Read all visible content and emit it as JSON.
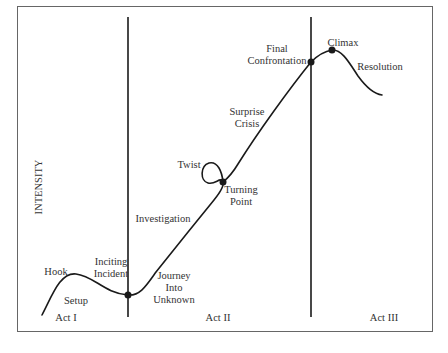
{
  "diagram": {
    "type": "story-arc",
    "y_axis_label": "INTENSITY",
    "acts": [
      {
        "label": "Act I",
        "x": 66,
        "y": 321
      },
      {
        "label": "Act II",
        "x": 218,
        "y": 321
      },
      {
        "label": "Act III",
        "x": 384,
        "y": 321
      }
    ],
    "act_dividers": [
      {
        "x": 128,
        "y1": 17,
        "y2": 317
      },
      {
        "x": 311,
        "y1": 17,
        "y2": 317
      }
    ],
    "key_points": [
      {
        "name": "Inciting Incident",
        "x": 128,
        "y": 295
      },
      {
        "name": "Turning Point",
        "x": 223,
        "y": 182
      },
      {
        "name": "Final Confrontation",
        "x": 311,
        "y": 62
      },
      {
        "name": "Climax",
        "x": 332,
        "y": 50
      }
    ],
    "labels": [
      {
        "id": "hook",
        "lines": [
          "Hook"
        ],
        "x": 56,
        "y": 275,
        "anchor": "middle"
      },
      {
        "id": "setup",
        "lines": [
          "Setup"
        ],
        "x": 76,
        "y": 304,
        "anchor": "middle"
      },
      {
        "id": "inciting-incident",
        "lines": [
          "Inciting",
          "Incident"
        ],
        "x": 111,
        "y": 265,
        "anchor": "middle"
      },
      {
        "id": "journey-into-unknown",
        "lines": [
          "Journey",
          "Into",
          "Unknown"
        ],
        "x": 174,
        "y": 279,
        "anchor": "middle"
      },
      {
        "id": "investigation",
        "lines": [
          "Investigation"
        ],
        "x": 163,
        "y": 222,
        "anchor": "middle"
      },
      {
        "id": "twist",
        "lines": [
          "Twist"
        ],
        "x": 189,
        "y": 168,
        "anchor": "middle"
      },
      {
        "id": "turning-point",
        "lines": [
          "Turning",
          "Point"
        ],
        "x": 241,
        "y": 193,
        "anchor": "middle"
      },
      {
        "id": "surprise-crisis",
        "lines": [
          "Surprise",
          "Crisis"
        ],
        "x": 247,
        "y": 115,
        "anchor": "middle"
      },
      {
        "id": "final-confrontation",
        "lines": [
          "Final",
          "Confrontation"
        ],
        "x": 277,
        "y": 52,
        "anchor": "middle"
      },
      {
        "id": "climax",
        "lines": [
          "Climax"
        ],
        "x": 343,
        "y": 46,
        "anchor": "middle"
      },
      {
        "id": "resolution",
        "lines": [
          "Resolution"
        ],
        "x": 380,
        "y": 70,
        "anchor": "middle"
      }
    ],
    "colors": {
      "line": "#1a1a1a",
      "frame": "#666666",
      "text": "#333333",
      "background": "#ffffff"
    }
  }
}
